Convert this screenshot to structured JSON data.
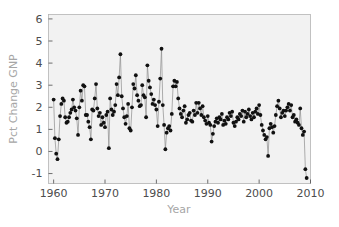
{
  "chart_data": {
    "type": "scatter",
    "title": "",
    "subtitle": "",
    "xlabel": "Year",
    "ylabel": "Pct Change GNP",
    "xlim": [
      1959.0,
      2010.0
    ],
    "ylim": [
      -1.45,
      6.2
    ],
    "xticks": [
      1960,
      1970,
      1980,
      1990,
      2000,
      2010
    ],
    "xtick_labels": [
      "1960",
      "1970",
      "1980",
      "1990",
      "2000",
      "2010"
    ],
    "yticks": [
      -1,
      0,
      1,
      2,
      3,
      4,
      5,
      6
    ],
    "ytick_labels": [
      "-1",
      "0",
      "1",
      "2",
      "3",
      "4",
      "5",
      "6"
    ],
    "grid": false,
    "legend": null,
    "legend_position": "none",
    "marker": "filled-circle",
    "marker_color": "#111111",
    "line_color": "#8c8c8c",
    "plot_background": "#f2f2f2",
    "frame_color": "#b3b3b3",
    "label_color": "#a6a6a6",
    "tick_color": "#4d4d4d",
    "series": [
      {
        "name": "Pct Change GNP",
        "x": [
          1960.0,
          1960.25,
          1960.5,
          1960.75,
          1961.0,
          1961.25,
          1961.5,
          1961.75,
          1962.0,
          1962.25,
          1962.5,
          1962.75,
          1963.0,
          1963.25,
          1963.5,
          1963.75,
          1964.0,
          1964.25,
          1964.5,
          1964.75,
          1965.0,
          1965.25,
          1965.5,
          1965.75,
          1966.0,
          1966.25,
          1966.5,
          1966.75,
          1967.0,
          1967.25,
          1967.5,
          1967.75,
          1968.0,
          1968.25,
          1968.5,
          1968.75,
          1969.0,
          1969.25,
          1969.5,
          1969.75,
          1970.0,
          1970.25,
          1970.5,
          1970.75,
          1971.0,
          1971.25,
          1971.5,
          1971.75,
          1972.0,
          1972.25,
          1972.5,
          1972.75,
          1973.0,
          1973.25,
          1973.5,
          1973.75,
          1974.0,
          1974.25,
          1974.5,
          1974.75,
          1975.0,
          1975.25,
          1975.5,
          1975.75,
          1976.0,
          1976.25,
          1976.5,
          1976.75,
          1977.0,
          1977.25,
          1977.5,
          1977.75,
          1978.0,
          1978.25,
          1978.5,
          1978.75,
          1979.0,
          1979.25,
          1979.5,
          1979.75,
          1980.0,
          1980.25,
          1980.5,
          1980.75,
          1981.0,
          1981.25,
          1981.5,
          1981.75,
          1982.0,
          1982.25,
          1982.5,
          1982.75,
          1983.0,
          1983.25,
          1983.5,
          1983.75,
          1984.0,
          1984.25,
          1984.5,
          1984.75,
          1985.0,
          1985.25,
          1985.5,
          1985.75,
          1986.0,
          1986.25,
          1986.5,
          1986.75,
          1987.0,
          1987.25,
          1987.5,
          1987.75,
          1988.0,
          1988.25,
          1988.5,
          1988.75,
          1989.0,
          1989.25,
          1989.5,
          1989.75,
          1990.0,
          1990.25,
          1990.5,
          1990.75,
          1991.0,
          1991.25,
          1991.5,
          1991.75,
          1992.0,
          1992.25,
          1992.5,
          1992.75,
          1993.0,
          1993.25,
          1993.5,
          1993.75,
          1994.0,
          1994.25,
          1994.5,
          1994.75,
          1995.0,
          1995.25,
          1995.5,
          1995.75,
          1996.0,
          1996.25,
          1996.5,
          1996.75,
          1997.0,
          1997.25,
          1997.5,
          1997.75,
          1998.0,
          1998.25,
          1998.5,
          1998.75,
          1999.0,
          1999.25,
          1999.5,
          1999.75,
          2000.0,
          2000.25,
          2000.5,
          2000.75,
          2001.0,
          2001.25,
          2001.5,
          2001.75,
          2002.0,
          2002.25,
          2002.5,
          2002.75,
          2003.0,
          2003.25,
          2003.5,
          2003.75,
          2004.0,
          2004.25,
          2004.5,
          2004.75,
          2005.0,
          2005.25,
          2005.5,
          2005.75,
          2006.0,
          2006.25,
          2006.5,
          2006.75,
          2007.0,
          2007.25,
          2007.5,
          2007.75,
          2008.0,
          2008.25,
          2008.5,
          2008.75,
          2009.0,
          2009.25
        ],
        "y": [
          2.35,
          0.6,
          -0.1,
          -0.35,
          0.55,
          1.6,
          2.15,
          2.4,
          2.3,
          1.55,
          1.3,
          1.35,
          1.55,
          1.75,
          1.9,
          2.35,
          2.0,
          1.85,
          1.5,
          0.75,
          2.0,
          2.75,
          2.3,
          3.0,
          2.95,
          1.65,
          1.65,
          1.35,
          1.1,
          0.55,
          1.9,
          1.85,
          2.4,
          3.05,
          1.95,
          1.6,
          1.75,
          1.2,
          1.55,
          1.3,
          1.1,
          1.65,
          1.8,
          0.15,
          2.4,
          1.9,
          1.65,
          1.8,
          2.1,
          3.05,
          2.55,
          3.35,
          4.4,
          2.5,
          1.95,
          1.55,
          1.25,
          1.6,
          2.15,
          1.05,
          0.95,
          2.0,
          3.05,
          2.85,
          3.45,
          2.55,
          2.3,
          2.05,
          2.1,
          3.0,
          2.55,
          2.45,
          1.55,
          3.9,
          3.2,
          2.9,
          2.6,
          2.15,
          2.35,
          2.1,
          1.9,
          1.15,
          2.25,
          3.3,
          4.65,
          2.1,
          1.2,
          0.1,
          0.85,
          1.05,
          1.15,
          0.95,
          1.7,
          2.95,
          3.2,
          2.95,
          3.15,
          2.4,
          1.95,
          1.7,
          1.55,
          1.85,
          2.05,
          1.3,
          1.45,
          1.65,
          1.75,
          1.4,
          1.35,
          1.85,
          1.65,
          2.2,
          1.75,
          2.2,
          1.95,
          1.65,
          2.05,
          1.55,
          1.4,
          1.25,
          1.6,
          1.3,
          1.2,
          0.45,
          0.8,
          1.15,
          1.35,
          1.5,
          1.3,
          1.55,
          1.45,
          1.7,
          1.2,
          1.4,
          1.25,
          1.55,
          1.45,
          1.75,
          1.6,
          1.8,
          1.3,
          1.15,
          1.35,
          1.55,
          1.45,
          1.7,
          1.6,
          1.85,
          1.35,
          1.8,
          1.55,
          1.7,
          1.9,
          1.6,
          1.45,
          1.75,
          1.55,
          1.8,
          1.95,
          1.7,
          2.1,
          1.65,
          1.2,
          0.95,
          0.75,
          0.55,
          0.65,
          -0.2,
          1.05,
          1.25,
          1.1,
          0.85,
          1.15,
          1.65,
          2.05,
          2.3,
          1.95,
          1.55,
          1.75,
          1.85,
          1.6,
          1.85,
          2.0,
          2.15,
          1.85,
          2.1,
          1.55,
          1.65,
          1.35,
          1.45,
          1.3,
          1.2,
          1.95,
          1.05,
          0.75,
          0.9,
          -0.8,
          -1.2
        ]
      }
    ],
    "notable_points": {
      "maximum": {
        "x": 1978.25,
        "y": 5.65
      },
      "minimum": {
        "x": 2009.25,
        "y": -1.2
      },
      "early_low": {
        "x": 1960.9,
        "y": -1.0
      }
    },
    "n_points": 200
  }
}
